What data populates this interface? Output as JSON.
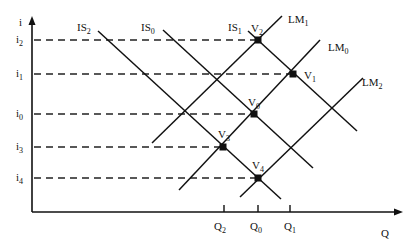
{
  "axes": {
    "y_label": "i",
    "x_label": "Q"
  },
  "interest_levels": [
    {
      "name": "i",
      "sub": "2",
      "y": 40
    },
    {
      "name": "i",
      "sub": "1",
      "y": 74
    },
    {
      "name": "i",
      "sub": "0",
      "y": 114
    },
    {
      "name": "i",
      "sub": "3",
      "y": 147
    },
    {
      "name": "i",
      "sub": "4",
      "y": 178
    }
  ],
  "output_levels": [
    {
      "name": "Q",
      "sub": "2",
      "x": 224
    },
    {
      "name": "Q",
      "sub": "0",
      "x": 258
    },
    {
      "name": "Q",
      "sub": "1",
      "x": 290
    }
  ],
  "curves": [
    {
      "name": "IS",
      "sub": "2",
      "type": "IS"
    },
    {
      "name": "IS",
      "sub": "0",
      "type": "IS"
    },
    {
      "name": "IS",
      "sub": "1",
      "type": "IS"
    },
    {
      "name": "LM",
      "sub": "1",
      "type": "LM"
    },
    {
      "name": "LM",
      "sub": "0",
      "type": "LM"
    },
    {
      "name": "LM",
      "sub": "2",
      "type": "LM"
    }
  ],
  "points": [
    {
      "name": "V",
      "sub": "2"
    },
    {
      "name": "V",
      "sub": "1"
    },
    {
      "name": "V",
      "sub": "0"
    },
    {
      "name": "V",
      "sub": "3"
    },
    {
      "name": "V",
      "sub": "4"
    }
  ]
}
